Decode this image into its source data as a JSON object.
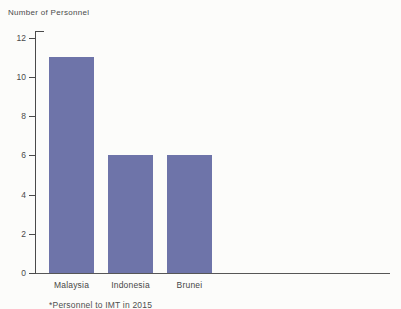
{
  "page": {
    "background": "#fcfcfa"
  },
  "chart_data": {
    "type": "bar",
    "title": "Number of Personnel",
    "categories": [
      "Malaysia",
      "Indonesia",
      "Brunei"
    ],
    "values": [
      11,
      6,
      6
    ],
    "xlabel": "",
    "ylabel": "Number of Personnel",
    "ylim": [
      0,
      12
    ],
    "yticks": [
      12,
      10,
      8,
      6,
      4,
      2,
      0
    ],
    "grid": false,
    "legend": "none",
    "bar_color": "#6e74a9",
    "axis_color": "#4a4a4a",
    "caption": "*Personnel to IMT in 2015"
  }
}
